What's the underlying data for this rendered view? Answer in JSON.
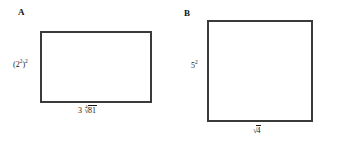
{
  "figure": {
    "background_color": "#ffffff",
    "outline_color": "#3a3a3a",
    "text_color": "#1a1a1a"
  },
  "shapes": [
    {
      "id": "a",
      "letter": "A",
      "kind": "rectangle",
      "left_label": {
        "text": "(2²)²",
        "base": "(2",
        "inner_exponent": "2",
        "close": ")",
        "outer_exponent": "2"
      },
      "bottom_label": {
        "text": "3∜81",
        "coefficient": "3",
        "radical_index": "4",
        "radical_sign": "√",
        "radicand": "81"
      }
    },
    {
      "id": "b",
      "letter": "B",
      "kind": "square",
      "left_label": {
        "text": "5²",
        "base": "5",
        "exponent": "2"
      },
      "bottom_label": {
        "text": "√4",
        "coefficient": "",
        "radical_index": "",
        "radical_sign": "√",
        "radicand": "4"
      }
    }
  ]
}
